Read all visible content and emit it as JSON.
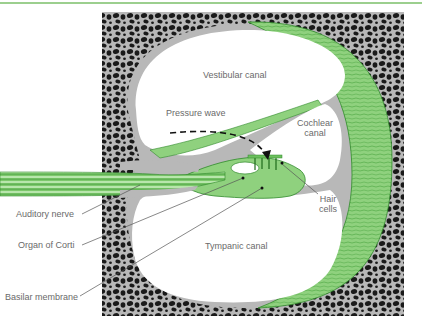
{
  "figure": {
    "colors": {
      "tissue_green": "#8fd17e",
      "tissue_line": "#2f8a2a",
      "bone_gray": "#b8b8b8",
      "bone_cells": "#1a1a1a",
      "label_text": "#6a6a6a",
      "top_rule": "#9ccf8e"
    }
  },
  "labels": {
    "vestibular_canal": "Vestibular canal",
    "pressure_wave": "Pressure wave",
    "cochlear_canal_line1": "Cochlear",
    "cochlear_canal_line2": "canal",
    "hair_cells_line1": "Hair",
    "hair_cells_line2": "cells",
    "tympanic_canal": "Tympanic canal",
    "auditory_nerve": "Auditory nerve",
    "organ_of_corti": "Organ of Corti",
    "basilar_membrane": "Basilar membrane"
  }
}
